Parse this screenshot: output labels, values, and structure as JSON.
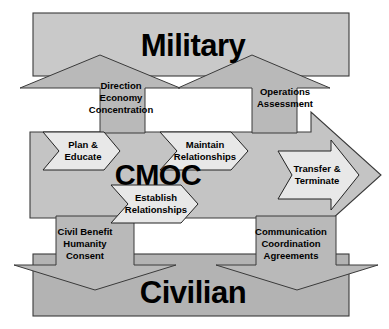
{
  "diagram": {
    "colors": {
      "military_band": "#c9c9c9",
      "civilian_band": "#b3b3b3",
      "cmoc_band": "#c4c4c4",
      "vertical_arrow": "#b9b9b9",
      "chevron_fill": "#e8e8e8",
      "outline": "#3a3a3a",
      "text": "#000000",
      "background": "#ffffff"
    },
    "bands": {
      "military": {
        "label": "Military"
      },
      "cmoc": {
        "label": "CMOC"
      },
      "civilian": {
        "label": "Civilian"
      }
    },
    "vertical_arrows": [
      {
        "id": "civilian-to-military-left",
        "direction": "up",
        "lines": [
          "Direction",
          "Economy",
          "Concentration"
        ]
      },
      {
        "id": "civilian-to-military-right",
        "direction": "up",
        "lines": [
          "Operations",
          "Assessment"
        ]
      },
      {
        "id": "military-to-civilian-left",
        "direction": "down",
        "lines": [
          "Civil Benefit",
          "Humanity",
          "Consent"
        ]
      },
      {
        "id": "military-to-civilian-right",
        "direction": "down",
        "lines": [
          "Communication",
          "Coordination",
          "Agreements"
        ]
      }
    ],
    "process_chevrons": [
      {
        "id": "plan-educate",
        "lines": [
          "Plan &",
          "Educate"
        ]
      },
      {
        "id": "maintain-relationships",
        "lines": [
          "Maintain",
          "Relationships"
        ]
      },
      {
        "id": "establish-relationships",
        "lines": [
          "Establish",
          "Relationships"
        ]
      },
      {
        "id": "transfer-terminate",
        "lines": [
          "Transfer &",
          "Terminate"
        ]
      }
    ]
  }
}
